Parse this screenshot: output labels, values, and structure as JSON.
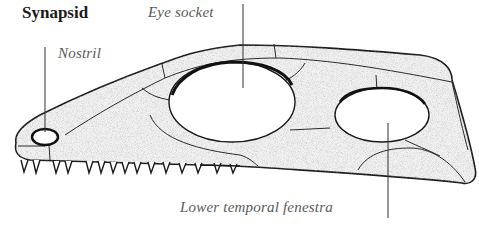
{
  "diagram": {
    "title": "Synapsid",
    "labels": {
      "eye_socket": "Eye socket",
      "nostril": "Nostril",
      "lower_temporal_fenestra": "Lower temporal fenestra"
    },
    "colors": {
      "outline": "#1a1a1a",
      "bone_fill": "#eeeeee",
      "stipple": "#b8b8b8",
      "label_text": "#5a5a5a",
      "leader_line": "#333333"
    },
    "teeth_count": 20
  }
}
